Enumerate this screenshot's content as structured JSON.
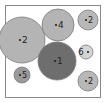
{
  "diagram": {
    "type": "circle-packing",
    "frame": {
      "x": 5,
      "y": 5,
      "width": 95,
      "height": 92,
      "stroke": "#888888"
    },
    "colors": {
      "light": "#b4b4b4",
      "lightest": "#d0d0d0",
      "mid": "#9a9a9a",
      "dark": "#6e6e6e",
      "stroke": "#7a7a7a",
      "label": "#222222"
    },
    "circles": [
      {
        "id": "c1",
        "label": "2",
        "cx": 22,
        "cy": 40,
        "r": 23,
        "fill": "#b4b4b4"
      },
      {
        "id": "c2",
        "label": "4",
        "cx": 58,
        "cy": 25,
        "r": 16,
        "fill": "#b4b4b4"
      },
      {
        "id": "c3",
        "label": "2",
        "cx": 88,
        "cy": 20,
        "r": 10,
        "fill": "#b8b8b8"
      },
      {
        "id": "c4",
        "label": "1",
        "cx": 57,
        "cy": 61,
        "r": 19,
        "fill": "#6e6e6e"
      },
      {
        "id": "c5",
        "label": "6",
        "cx": 86,
        "cy": 52,
        "r": 7,
        "fill": "#d4d4d4"
      },
      {
        "id": "c6",
        "label": "5",
        "cx": 22,
        "cy": 75,
        "r": 8,
        "fill": "#9a9a9a"
      },
      {
        "id": "c7",
        "label": "2",
        "cx": 88,
        "cy": 81,
        "r": 10,
        "fill": "#b8b8b8"
      }
    ]
  }
}
